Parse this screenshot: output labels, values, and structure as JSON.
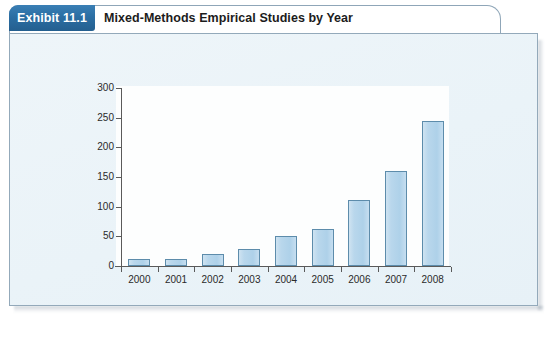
{
  "exhibit": {
    "tab_label": "Exhibit 11.1",
    "title": "Mixed-Methods Empirical Studies by Year"
  },
  "colors": {
    "tab_blue": "#2b6ea3",
    "bar_fill": "#b9d7ec",
    "bar_stroke": "#5d8cab",
    "panel_bg": "#eaf3f8",
    "plot_bg": "#fdfefe",
    "axis": "#5a5a5a",
    "border": "#93a9ba"
  },
  "chart_data": {
    "type": "bar",
    "title": "Mixed-Methods Empirical Studies by Year",
    "xlabel": "",
    "ylabel": "",
    "categories": [
      "2000",
      "2001",
      "2002",
      "2003",
      "2004",
      "2005",
      "2006",
      "2007",
      "2008"
    ],
    "values": [
      12,
      11,
      21,
      29,
      50,
      62,
      111,
      160,
      244
    ],
    "ylim": [
      0,
      300
    ],
    "yticks": [
      0,
      50,
      100,
      150,
      200,
      250,
      300
    ],
    "ytick_labels": [
      "0",
      "50",
      "100",
      "150",
      "200",
      "250",
      "300"
    ],
    "grid": false,
    "legend": null
  }
}
